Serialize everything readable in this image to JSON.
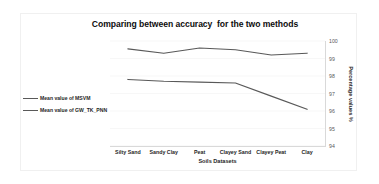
{
  "chart_data": {
    "type": "line",
    "title": "Comparing between accuracy  for the two methods",
    "xlabel": "Soils Datasets",
    "ylabel": "Percentage values %",
    "categories": [
      "Silty Sand",
      "Sandy Clay",
      "Peat",
      "Clayey Sand",
      "Clayey Peat",
      "Clay"
    ],
    "series": [
      {
        "name": "Mean value of MSVM",
        "color": "#595959",
        "values": [
          97.8,
          97.7,
          97.65,
          97.6,
          96.85,
          96.1
        ]
      },
      {
        "name": "Mean value of GW_TK_PNN",
        "color": "#595959",
        "values": [
          99.55,
          99.3,
          99.6,
          99.5,
          99.2,
          99.3
        ]
      }
    ],
    "ylim": [
      94,
      100
    ],
    "yticks": [
      100,
      99,
      98,
      97,
      96,
      95,
      94
    ],
    "ytick_labels": [
      "100",
      "99",
      "98",
      "97",
      "96",
      "95",
      "94"
    ],
    "grid": true,
    "grid_color": "#f2f2f2",
    "axis_color": "#d9d9d9",
    "legend_position": "left-outside",
    "y_axis_side": "right"
  },
  "legend": {
    "entries": [
      {
        "label": "Mean value of MSVM"
      },
      {
        "label": "Mean value of GW_TK_PNN"
      }
    ]
  }
}
